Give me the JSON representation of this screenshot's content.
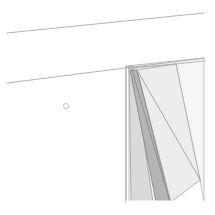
{
  "drawing": {
    "title": "Architectural corner line drawing",
    "canvas": {
      "width": 215,
      "height": 215,
      "background": "#ffffff"
    },
    "palette": {
      "background": "#ffffff",
      "stroke_light": "#b9b9b9",
      "stroke_mid": "#9a9a9a",
      "stroke_dark": "#707070",
      "fill_pale": "#f2f2f2",
      "fill_light": "#ececec",
      "fill_mid": "#d9d9d9",
      "fill_shadow": "#bdbdbd",
      "fill_dark": "#a8a8a8",
      "marker_stroke": "#bdbdbd"
    },
    "elements": {
      "ceiling_line_upper": {
        "name": "upper ceiling edge",
        "x1": 7,
        "y1": 33,
        "x2": 204,
        "y2": 13,
        "color": "#a9a9a9",
        "width": 0.9
      },
      "ceiling_line_lower": {
        "name": "lower ceiling edge",
        "x1": 7,
        "y1": 83,
        "x2": 204,
        "y2": 58,
        "color": "#a9a9a9",
        "width": 0.9
      },
      "jamb_outer_edge": {
        "name": "vertical jamb outer edge",
        "x1": 126,
        "y1": 66,
        "x2": 126,
        "y2": 202,
        "color": "#8c8c8c",
        "width": 1.0
      },
      "jamb_inner_edge": {
        "name": "vertical jamb inner edge",
        "x1": 129,
        "y1": 66,
        "x2": 129,
        "y2": 202,
        "color": "#b4b4b4",
        "width": 0.8
      },
      "reveal_band": {
        "name": "dark angled reveal band",
        "points": "130,70 137,70 170,202 156,202",
        "fill": "#b5b5b5",
        "stroke": "#7d7d7d"
      },
      "panel_left": {
        "name": "narrow left panel strip",
        "points": "129,66 133,66 153,202 131,202",
        "fill": "#dadada",
        "stroke": "#9c9c9c"
      },
      "panel_main": {
        "name": "large light door panel face",
        "points": "137,70 176,64 200,180 171,202",
        "fill": "#ededed",
        "stroke": "#a4a4a4"
      },
      "panel_right": {
        "name": "right return face",
        "points": "176,64 204,60 204,202 200,180",
        "fill": "#f6f6f6",
        "stroke": "#b8b8b8"
      },
      "head_sliver": {
        "name": "head jamb sliver under ceiling line",
        "points": "126,66 204,58 204,61 129,69",
        "fill": "#f0f0f0",
        "stroke": "#b0b0b0"
      },
      "diagonal_top": {
        "name": "upper diagonal construction line",
        "x1": 129,
        "y1": 68,
        "x2": 176,
        "y2": 64,
        "color": "#aaaaaa",
        "width": 0.8
      },
      "diagonal_long": {
        "name": "long diagonal panel edge",
        "x1": 137,
        "y1": 70,
        "x2": 201,
        "y2": 181,
        "color": "#9e9e9e",
        "width": 0.9
      },
      "diagonal_inner": {
        "name": "inner diagonal shadow edge",
        "x1": 132,
        "y1": 70,
        "x2": 170,
        "y2": 202,
        "color": "#8a8a8a",
        "width": 0.9
      },
      "bottom_cut": {
        "name": "bottom crop edge of panels",
        "x1": 126,
        "y1": 202,
        "x2": 204,
        "y2": 202,
        "color": "#ffffff",
        "width": 1.0
      },
      "circle_marker": {
        "name": "small circular annotation marker",
        "cx": 66,
        "cy": 106,
        "r": 2.6,
        "stroke": "#bdbdbd",
        "fill": "#ffffff",
        "width": 0.9
      }
    }
  }
}
